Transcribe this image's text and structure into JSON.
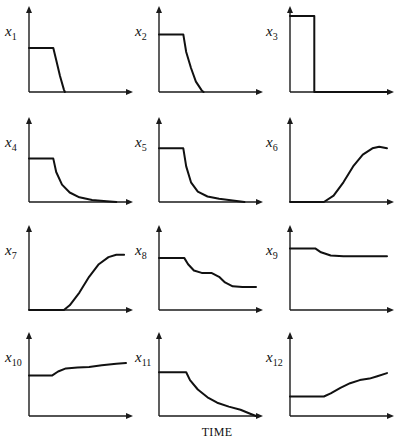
{
  "figure": {
    "xlabel": "TIME"
  },
  "chart_data": {
    "type": "line",
    "title": "",
    "xlabel": "TIME",
    "ylabel": "",
    "grid": false,
    "layout": {
      "rows": 4,
      "cols": 3
    },
    "note": "Twelve small-multiple time-response plots; values are normalized (time 0-1, amplitude 0-1 relative to panel height). No tick labels shown.",
    "panels": [
      {
        "label_base": "x",
        "label_sub": "1",
        "x": [
          0,
          0.25,
          0.28,
          0.32,
          0.36,
          0.37
        ],
        "y": [
          0.55,
          0.55,
          0.4,
          0.2,
          0.03,
          0
        ]
      },
      {
        "label_base": "x",
        "label_sub": "2",
        "x": [
          0,
          0.25,
          0.28,
          0.33,
          0.38,
          0.44,
          0.46
        ],
        "y": [
          0.72,
          0.72,
          0.5,
          0.3,
          0.13,
          0.02,
          0
        ]
      },
      {
        "label_base": "x",
        "label_sub": "3",
        "x": [
          0,
          0.25,
          0.25,
          1
        ],
        "y": [
          0.95,
          0.95,
          0,
          0
        ]
      },
      {
        "label_base": "x",
        "label_sub": "4",
        "x": [
          0,
          0.25,
          0.28,
          0.34,
          0.42,
          0.52,
          0.65,
          0.8,
          0.9
        ],
        "y": [
          0.55,
          0.55,
          0.38,
          0.22,
          0.12,
          0.06,
          0.025,
          0.01,
          0
        ]
      },
      {
        "label_base": "x",
        "label_sub": "5",
        "x": [
          0,
          0.25,
          0.28,
          0.33,
          0.4,
          0.5,
          0.62,
          0.76,
          0.88
        ],
        "y": [
          0.68,
          0.68,
          0.45,
          0.25,
          0.13,
          0.07,
          0.04,
          0.02,
          0
        ]
      },
      {
        "label_base": "x",
        "label_sub": "6",
        "x": [
          0,
          0.35,
          0.45,
          0.55,
          0.65,
          0.75,
          0.85,
          0.92,
          1.0
        ],
        "y": [
          0,
          0,
          0.08,
          0.25,
          0.45,
          0.6,
          0.68,
          0.7,
          0.68
        ]
      },
      {
        "label_base": "x",
        "label_sub": "7",
        "x": [
          0,
          0.36,
          0.42,
          0.52,
          0.62,
          0.72,
          0.82,
          0.9,
          0.98
        ],
        "y": [
          0,
          0,
          0.06,
          0.22,
          0.42,
          0.58,
          0.67,
          0.7,
          0.7
        ]
      },
      {
        "label_base": "x",
        "label_sub": "8",
        "x": [
          0,
          0.26,
          0.3,
          0.36,
          0.44,
          0.54,
          0.62,
          0.68,
          0.76,
          0.86,
          1.0
        ],
        "y": [
          0.66,
          0.66,
          0.58,
          0.5,
          0.47,
          0.47,
          0.42,
          0.35,
          0.3,
          0.29,
          0.29
        ]
      },
      {
        "label_base": "x",
        "label_sub": "9",
        "x": [
          0,
          0.26,
          0.32,
          0.42,
          0.55,
          0.7,
          0.85,
          1.0
        ],
        "y": [
          0.78,
          0.78,
          0.73,
          0.69,
          0.68,
          0.68,
          0.68,
          0.68
        ]
      },
      {
        "label_base": "x",
        "label_sub": "10",
        "x": [
          0,
          0.24,
          0.3,
          0.38,
          0.5,
          0.62,
          0.75,
          0.9,
          1.0
        ],
        "y": [
          0.52,
          0.52,
          0.57,
          0.61,
          0.62,
          0.63,
          0.65,
          0.67,
          0.68
        ]
      },
      {
        "label_base": "x",
        "label_sub": "11",
        "x": [
          0,
          0.28,
          0.32,
          0.4,
          0.5,
          0.6,
          0.72,
          0.84,
          0.94,
          1.0
        ],
        "y": [
          0.56,
          0.56,
          0.46,
          0.34,
          0.24,
          0.17,
          0.12,
          0.08,
          0.03,
          0
        ]
      },
      {
        "label_base": "x",
        "label_sub": "12",
        "x": [
          0,
          0.35,
          0.42,
          0.52,
          0.62,
          0.72,
          0.82,
          0.9,
          1.0
        ],
        "y": [
          0.25,
          0.25,
          0.29,
          0.36,
          0.42,
          0.46,
          0.48,
          0.51,
          0.55
        ]
      }
    ]
  }
}
